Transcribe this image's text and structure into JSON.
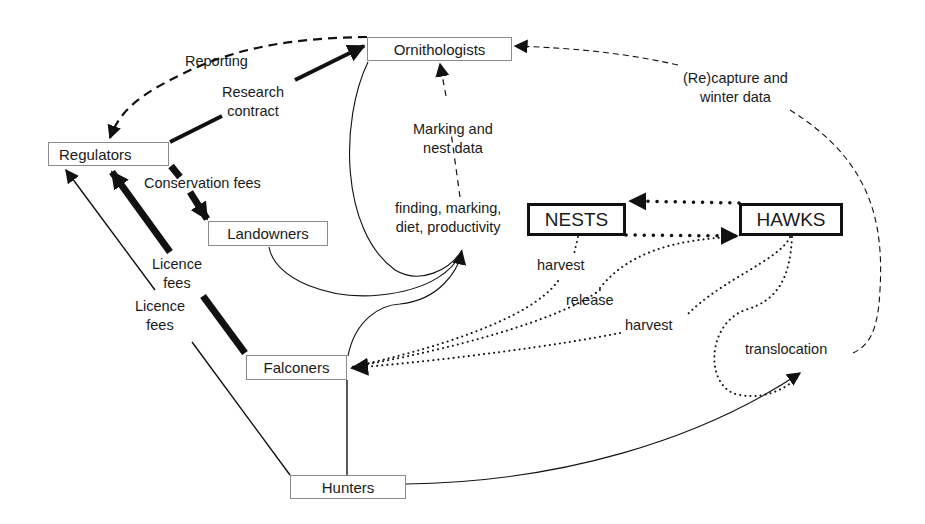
{
  "nodes": {
    "ornithologists": "Ornithologists",
    "regulators": "Regulators",
    "landowners": "Landowners",
    "nests": "NESTS",
    "hawks": "HAWKS",
    "falconers": "Falconers",
    "hunters": "Hunters"
  },
  "edge_labels": {
    "reporting": "Reporting",
    "research_contract_1": "Research",
    "research_contract_2": "contract",
    "conservation_fees": "Conservation fees",
    "licence_fees_falconers_1": "Licence",
    "licence_fees_falconers_2": "fees",
    "licence_fees_hunters_1": "Licence",
    "licence_fees_hunters_2": "fees",
    "marking_nest_data_1": "Marking and",
    "marking_nest_data_2": "nest data",
    "finding_1": "finding, marking,",
    "finding_2": "diet, productivity",
    "recapture_1": "(Re)capture and",
    "recapture_2": "winter data",
    "harvest_nests": "harvest",
    "release": "release",
    "harvest_hawks": "harvest",
    "translocation": "translocation"
  },
  "legend_styles": {
    "money_flow": "thick solid",
    "information_flow": "dashed",
    "bird_flow": "dotted",
    "activity": "thin solid"
  }
}
